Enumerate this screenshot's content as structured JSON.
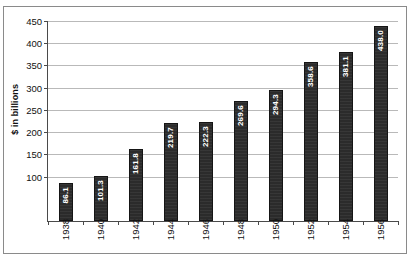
{
  "chart_data": {
    "type": "bar",
    "title": "",
    "xlabel": "",
    "ylabel": "$ in billions",
    "categories": [
      "1938",
      "1940",
      "1942",
      "1944",
      "1946",
      "1948",
      "1950",
      "1952",
      "1954",
      "1956"
    ],
    "values": [
      86.1,
      101.3,
      161.8,
      219.7,
      222.3,
      269.6,
      294.3,
      358.6,
      381.1,
      438.0
    ],
    "value_labels": [
      "86.1",
      "101.3",
      "161.8",
      "219.7",
      "222.3",
      "269.6",
      "294.3",
      "358.6",
      "381.1",
      "438.0"
    ],
    "ylim": [
      0,
      450
    ],
    "yticks": [
      100,
      150,
      200,
      250,
      300,
      350,
      400,
      450
    ],
    "ytick_labels": [
      "100",
      "150",
      "200",
      "250",
      "300",
      "350",
      "400",
      "450"
    ],
    "grid": true,
    "legend": null,
    "bar_color": "#2b2b2b",
    "value_label_color": "#ffffff",
    "gridline_color": "#b9b9b9",
    "axis_color": "#4a4a4a",
    "frame_color": "#8a8a8a",
    "background_color": "#ffffff"
  }
}
